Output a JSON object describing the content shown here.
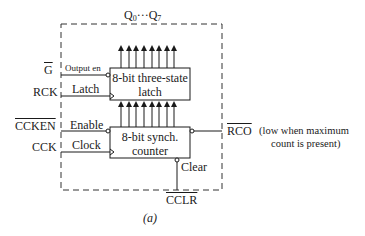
{
  "diagram": {
    "caption": "(a)",
    "bus_label": {
      "prefix": "Q",
      "first_sub": "0",
      "dots": "···",
      "last_sub": "7"
    },
    "inputs": [
      {
        "name": "G",
        "inverted": true,
        "pin_label": "Output en",
        "block": "latch",
        "pin_type": "active-low"
      },
      {
        "name": "RCK",
        "inverted": false,
        "pin_label": "Latch",
        "block": "latch",
        "pin_type": "clock"
      },
      {
        "name": "CCKEN",
        "inverted": true,
        "pin_label": "Enable",
        "block": "counter",
        "pin_type": "active-low"
      },
      {
        "name": "CCK",
        "inverted": false,
        "pin_label": "Clock",
        "block": "counter",
        "pin_type": "clock"
      }
    ],
    "blocks": {
      "latch": {
        "line1": "8-bit three-state",
        "line2": "latch"
      },
      "counter": {
        "line1": "8-bit synch.",
        "line2": "counter"
      }
    },
    "outputs": {
      "rco": {
        "name": "RCO",
        "inverted": true,
        "note_line1": "(low when maximum",
        "note_line2": "count is present)"
      }
    },
    "clear": {
      "pin_label": "Clear",
      "signal": "CCLR",
      "inverted": true
    },
    "bus_width": 8
  }
}
